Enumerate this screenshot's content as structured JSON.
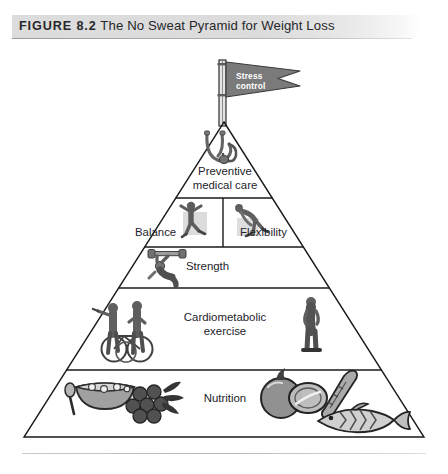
{
  "figure": {
    "label": "FIGURE 8.2",
    "title": "The No Sweat Pyramid for Weight Loss",
    "full_caption": "FIGURE 8.2 The No Sweat Pyramid for Weight Loss"
  },
  "flag": {
    "text": "Stress\ncontrol",
    "line1": "Stress",
    "line2": "control",
    "color": "#7a7a7a",
    "text_color": "#ffffff"
  },
  "pyramid": {
    "tiers": [
      {
        "index": 1,
        "name": "preventive-medical-care",
        "label": "Preventive\nmedical care",
        "icons": [
          "stethoscope-icon"
        ]
      },
      {
        "index": 2,
        "name": "balance-flexibility",
        "split": true,
        "left": {
          "label": "Balance",
          "icons": [
            "balance-exercise-icon"
          ]
        },
        "right": {
          "label": "Flexibility",
          "icons": [
            "stretching-exercise-icon"
          ]
        }
      },
      {
        "index": 3,
        "name": "strength",
        "label": "Strength",
        "icons": [
          "weightlifter-icon"
        ]
      },
      {
        "index": 4,
        "name": "cardiometabolic-exercise",
        "label": "Cardiometabolic\nexercise",
        "icons": [
          "cyclists-icon",
          "walker-icon"
        ]
      },
      {
        "index": 5,
        "name": "nutrition",
        "label": "Nutrition",
        "icons": [
          "cereal-bowl-icon",
          "grapes-icon",
          "tomato-icon",
          "asparagus-icon",
          "fish-icon"
        ]
      }
    ]
  },
  "colors": {
    "band": "#dcdcdc",
    "outline": "#1a1a1a",
    "art_dark": "#4a4a4a",
    "art_mid": "#8c8c8c",
    "art_light": "#c4c4c4",
    "page_background": "#ffffff"
  }
}
